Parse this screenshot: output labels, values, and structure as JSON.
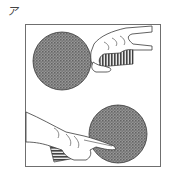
{
  "figure": {
    "label": "ア",
    "panels": [
      {
        "name": "top-paddle",
        "view": "forehand side, hand gripping handle from right",
        "blade_color": "#7a7a7a",
        "handle_color": "#555555"
      },
      {
        "name": "bottom-paddle",
        "view": "backhand side, hand from left with index finger extended on blade",
        "blade_color": "#7a7a7a",
        "handle_color": "#555555"
      }
    ],
    "colors": {
      "line": "#3a3a3a",
      "frame": "#6f6f6f",
      "background": "#ffffff"
    }
  }
}
